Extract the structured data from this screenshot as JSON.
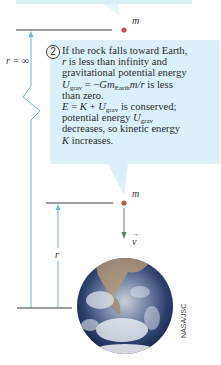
{
  "diagram": {
    "step_number": "2",
    "mass_label": "m",
    "r_infinity_label": "r = ∞",
    "r_label": "r",
    "velocity_label": "v",
    "callout_lines": [
      "If the rock falls toward Earth,",
      "r is less than infinity and",
      "gravitational potential energy",
      "U_grav = −Gm_Earth m/r is less",
      "than zero.",
      "E = K + U_grav is conserved;",
      "potential energy U_grav",
      "decreases, so kinetic energy",
      "K increases."
    ],
    "callout_rich": {
      "l1": "If the rock falls toward Earth,",
      "l2_a": "r",
      "l2_b": " is less than infinity and",
      "l3": "gravitational potential energy",
      "l4_U": "U",
      "l4_sub": "grav",
      "l4_eq": " = −",
      "l4_Gm": "Gm",
      "l4_sub2": "Earth",
      "l4_mr": "m/r",
      "l4_tail": " is less",
      "l5": "than zero.",
      "l6_E": "E",
      "l6_eq": " = ",
      "l6_K": "K",
      "l6_plus": " + ",
      "l6_U": "U",
      "l6_sub": "grav",
      "l6_tail": " is conserved;",
      "l7_a": "potential energy ",
      "l7_U": "U",
      "l7_sub": "grav",
      "l8": "decreases, so kinetic energy",
      "l9_K": "K",
      "l9_tail": " increases."
    },
    "image_credit": "NASA/JSC",
    "colors": {
      "callout_bg": "#dcf1f7",
      "arrow_blue": "#6fb6d9",
      "arrow_green": "#4c8a5a",
      "mass_red": "#c9524a",
      "line_dark": "#3a3a3a"
    }
  }
}
